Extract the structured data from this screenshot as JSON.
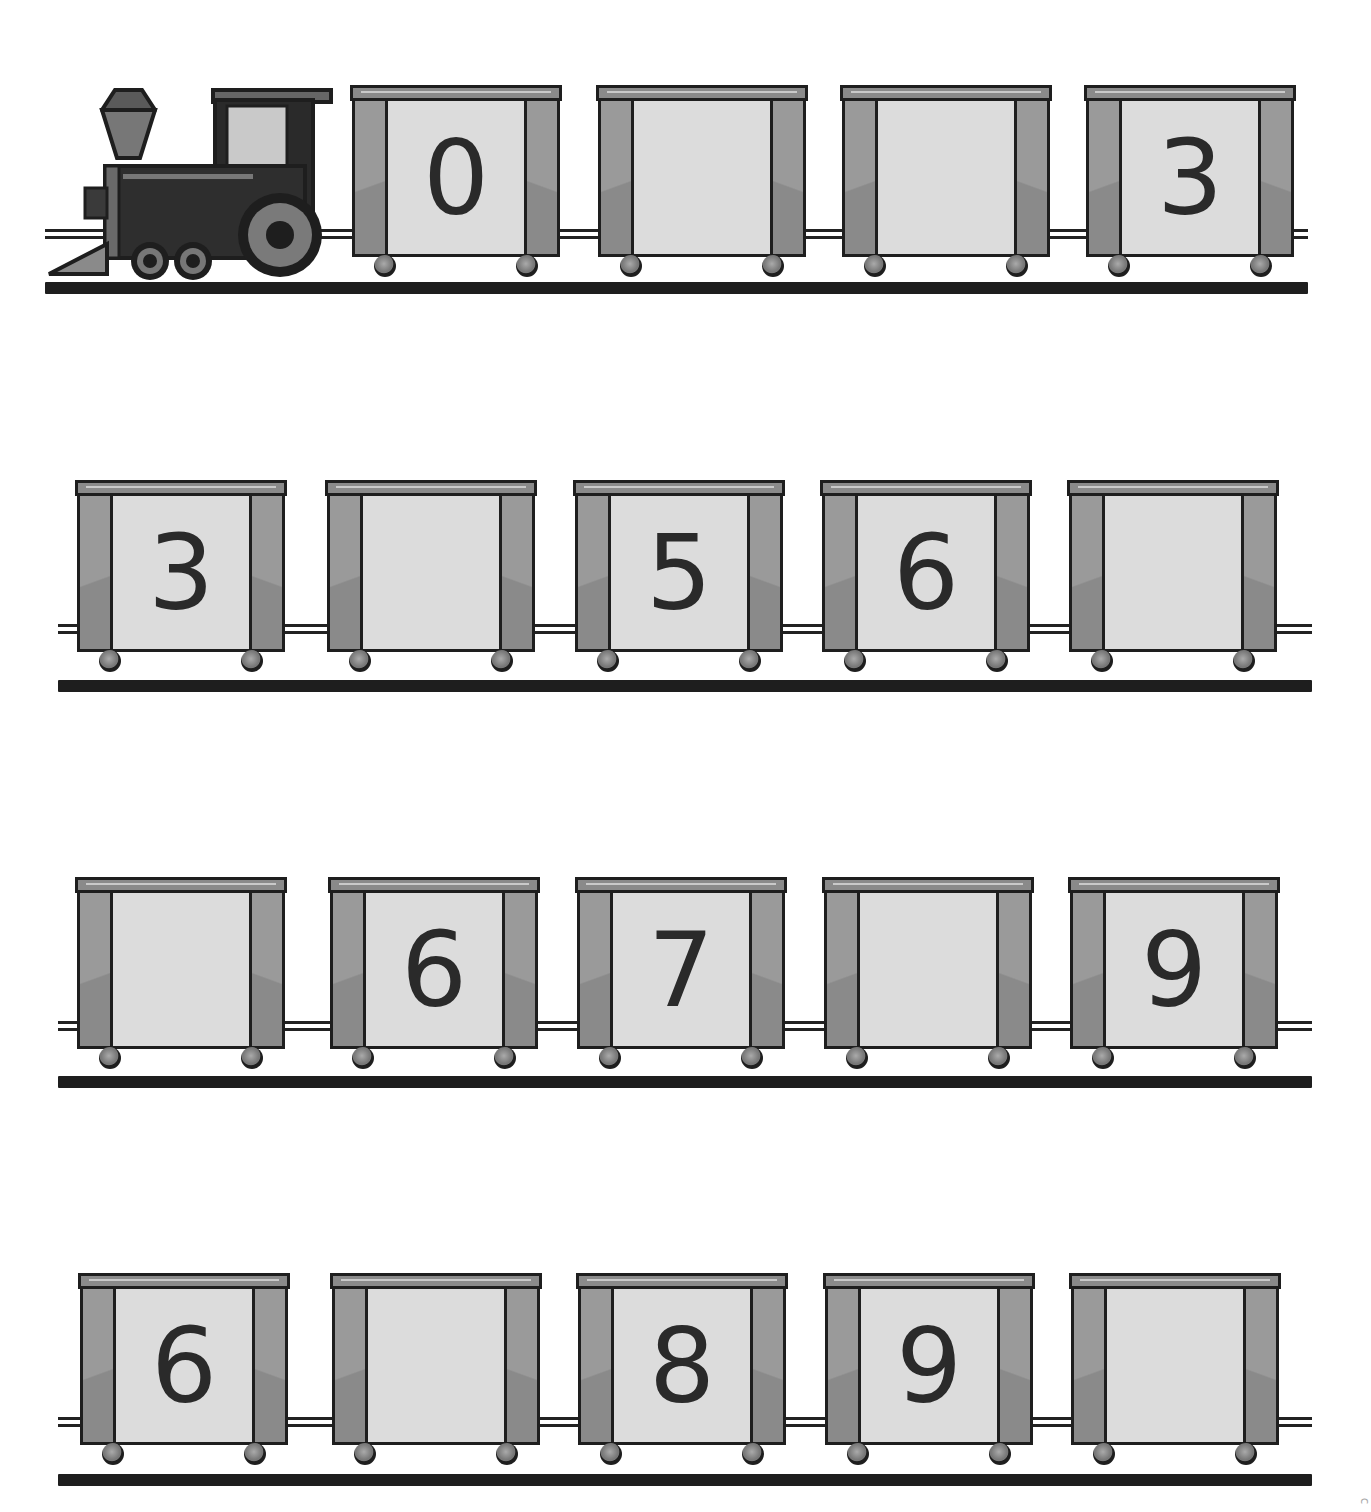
{
  "worksheet": {
    "type": "number-train-fill-in-missing",
    "rows": [
      {
        "has_locomotive": true,
        "cars": [
          "0",
          "",
          "",
          "3"
        ]
      },
      {
        "has_locomotive": false,
        "cars": [
          "3",
          "",
          "5",
          "6",
          ""
        ]
      },
      {
        "has_locomotive": false,
        "cars": [
          "",
          "6",
          "7",
          "",
          "9"
        ]
      },
      {
        "has_locomotive": false,
        "cars": [
          "6",
          "",
          "8",
          "9",
          ""
        ]
      }
    ],
    "colors": {
      "outline": "#1e1e1e",
      "panel": "#dcdcdc",
      "post": "#9a9a9a",
      "roof": "#8a8a8a",
      "track": "#1e1e1e"
    },
    "corner_mark": "c"
  }
}
